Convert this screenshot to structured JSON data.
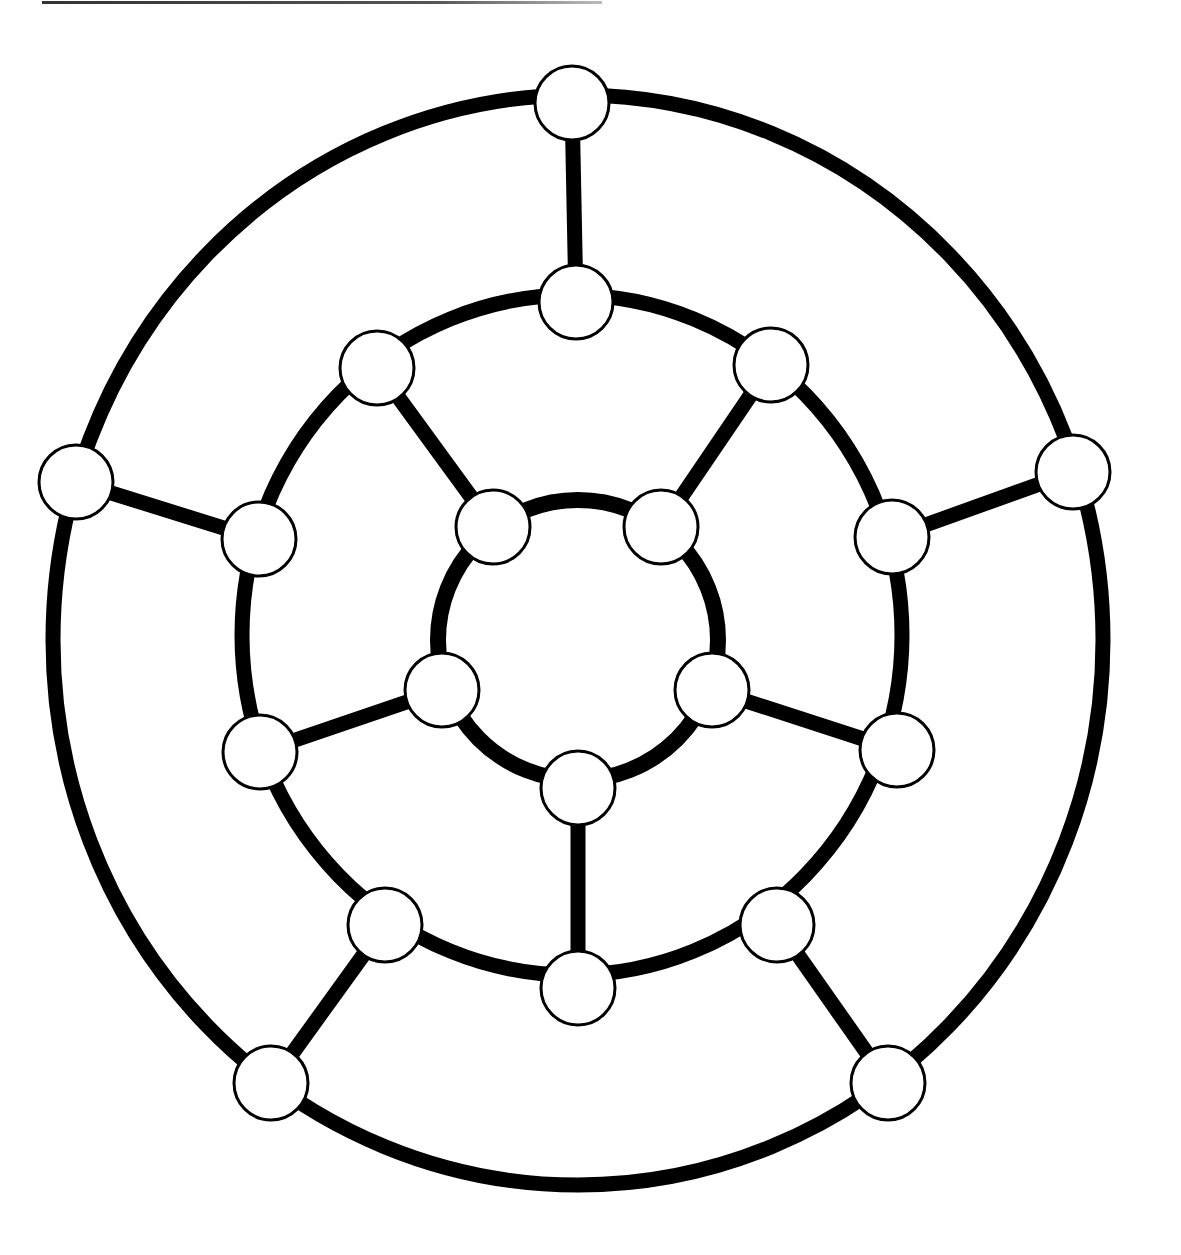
{
  "diagram": {
    "type": "graph",
    "colors": {
      "edge": "#000000",
      "node_fill": "#ffffff",
      "node_stroke": "#000000",
      "background": "#ffffff"
    },
    "node_radius": 37,
    "rings": [
      {
        "name": "outer",
        "cx": 578,
        "cy": 640,
        "rx": 525,
        "ry": 545,
        "stroke_width": 15
      },
      {
        "name": "middle",
        "cx": 572,
        "cy": 635,
        "rx": 330,
        "ry": 340,
        "stroke_width": 15
      },
      {
        "name": "inner",
        "cx": 578,
        "cy": 640,
        "rx": 140,
        "ry": 140,
        "stroke_width": 16
      }
    ],
    "nodes": [
      {
        "id": "o1",
        "ring": "outer",
        "x": 572,
        "y": 103
      },
      {
        "id": "o2",
        "ring": "outer",
        "x": 1073,
        "y": 472
      },
      {
        "id": "o3",
        "ring": "outer",
        "x": 888,
        "y": 1083
      },
      {
        "id": "o4",
        "ring": "outer",
        "x": 271,
        "y": 1083
      },
      {
        "id": "o5",
        "ring": "outer",
        "x": 76,
        "y": 482
      },
      {
        "id": "m1",
        "ring": "middle",
        "x": 576,
        "y": 302
      },
      {
        "id": "m2",
        "ring": "middle",
        "x": 771,
        "y": 365
      },
      {
        "id": "m3",
        "ring": "middle",
        "x": 892,
        "y": 537
      },
      {
        "id": "m4",
        "ring": "middle",
        "x": 897,
        "y": 750
      },
      {
        "id": "m5",
        "ring": "middle",
        "x": 777,
        "y": 925
      },
      {
        "id": "m6",
        "ring": "middle",
        "x": 578,
        "y": 988
      },
      {
        "id": "m7",
        "ring": "middle",
        "x": 385,
        "y": 925
      },
      {
        "id": "m8",
        "ring": "middle",
        "x": 260,
        "y": 752
      },
      {
        "id": "m9",
        "ring": "middle",
        "x": 259,
        "y": 539
      },
      {
        "id": "m10",
        "ring": "middle",
        "x": 377,
        "y": 368
      },
      {
        "id": "i1",
        "ring": "inner",
        "x": 493,
        "y": 527
      },
      {
        "id": "i2",
        "ring": "inner",
        "x": 661,
        "y": 527
      },
      {
        "id": "i3",
        "ring": "inner",
        "x": 712,
        "y": 690
      },
      {
        "id": "i4",
        "ring": "inner",
        "x": 578,
        "y": 788
      },
      {
        "id": "i5",
        "ring": "inner",
        "x": 442,
        "y": 690
      }
    ],
    "spokes": [
      [
        "o1",
        "m1"
      ],
      [
        "o2",
        "m3"
      ],
      [
        "o3",
        "m5"
      ],
      [
        "o4",
        "m7"
      ],
      [
        "o5",
        "m9"
      ],
      [
        "m2",
        "i2"
      ],
      [
        "m4",
        "i3"
      ],
      [
        "m6",
        "i4"
      ],
      [
        "m8",
        "i5"
      ],
      [
        "m10",
        "i1"
      ]
    ]
  }
}
